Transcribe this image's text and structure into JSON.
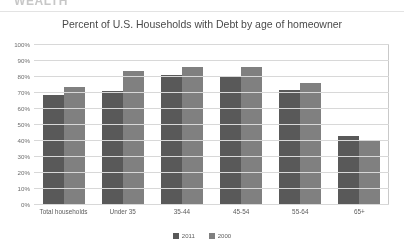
{
  "document": {
    "section_heading": "WEALTH"
  },
  "figure": {
    "title": "Percent of U.S. Households with Debt by age of homeowner"
  },
  "legend": {
    "position": "bottom-center",
    "entries": [
      {
        "label": "2011",
        "color": "#595959"
      },
      {
        "label": "2000",
        "color": "#808080"
      }
    ]
  },
  "chart_data": {
    "type": "bar",
    "title": "Percent of U.S. Households with Debt by age of homeowner",
    "xlabel": "",
    "ylabel": "",
    "ylim": [
      0,
      100
    ],
    "ytick_labels": [
      "100%",
      "90%",
      "80%",
      "70%",
      "60%",
      "50%",
      "40%",
      "30%",
      "20%",
      "10%",
      "0%"
    ],
    "ytick_values": [
      100,
      90,
      80,
      70,
      60,
      50,
      40,
      30,
      20,
      10,
      0
    ],
    "grid": true,
    "categories": [
      "Total households",
      "Under 35",
      "35-44",
      "45-54",
      "55-64",
      "65+"
    ],
    "series": [
      {
        "name": "2011",
        "color": "#595959",
        "values": [
          69,
          71,
          81,
          80,
          72,
          43
        ]
      },
      {
        "name": "2000",
        "color": "#808080",
        "values": [
          74,
          84,
          86,
          86,
          76,
          40
        ]
      }
    ]
  }
}
